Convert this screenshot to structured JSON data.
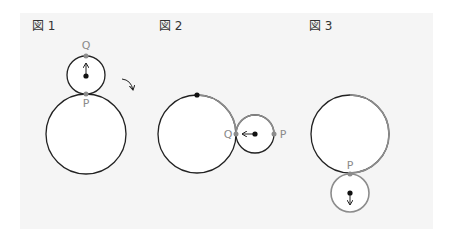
{
  "colors": {
    "background": "#ffffff",
    "panel": "#f5f5f5",
    "black_stroke": "#222222",
    "gray_stroke": "#8c8c8c",
    "point": "#8c8c8c",
    "center_dot": "#111111"
  },
  "figures": [
    {
      "label": "図 1",
      "points": {
        "Q": "Q",
        "P": "P"
      },
      "big_circle": {
        "cx": 86,
        "cy": 134,
        "r": 40
      },
      "small_circle": {
        "cx": 86,
        "cy": 75,
        "r": 19
      },
      "arrow_direction": "up",
      "rotation_icon": "clockwise-arrow"
    },
    {
      "label": "図 2",
      "points": {
        "Q": "Q",
        "P": "P"
      },
      "big_circle": {
        "cx": 197,
        "cy": 134,
        "r": 39
      },
      "small_circle": {
        "cx": 255,
        "cy": 134,
        "r": 19
      },
      "arrow_direction": "left",
      "marked_top_dot": true
    },
    {
      "label": "図 3",
      "points": {
        "P": "P"
      },
      "big_circle": {
        "cx": 350,
        "cy": 134,
        "r": 39
      },
      "small_circle": {
        "cx": 350,
        "cy": 194,
        "r": 19
      },
      "arrow_direction": "down"
    }
  ]
}
